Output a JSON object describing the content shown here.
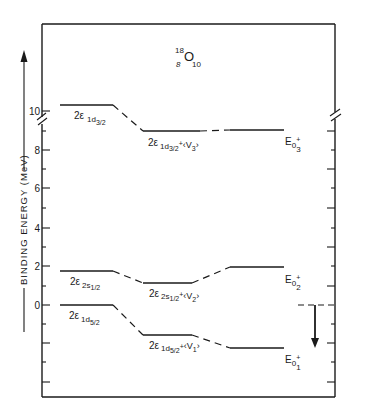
{
  "title": {
    "mass_number": "18",
    "element": "O",
    "proton_number": "8",
    "neutron_number": "10"
  },
  "axis": {
    "label": "BINDING ENERGY (MeV)",
    "direction_arrow": "up",
    "ticks": [
      "10",
      "8",
      "6",
      "4",
      "2",
      "0"
    ],
    "tick_values": [
      10,
      8,
      6,
      4,
      2,
      0
    ],
    "axis_break_between": [
      8,
      10
    ]
  },
  "levels": {
    "unperturbed": [
      {
        "id": "1d3/2",
        "prefix": "2ε",
        "sub": "1d",
        "subsub": "3/2",
        "energy": 10.3
      },
      {
        "id": "2s1/2",
        "prefix": "2ε",
        "sub": "2s",
        "subsub": "1/2",
        "energy": 1.7
      },
      {
        "id": "1d5/2",
        "prefix": "2ε",
        "sub": "1d",
        "subsub": "5/2",
        "energy": 0.0
      }
    ],
    "diagonal": [
      {
        "prefix": "2ε",
        "sub": "1d",
        "subsub": "3/2",
        "plus": "+",
        "v": "V",
        "vsub": "3",
        "energy": 8.9
      },
      {
        "prefix": "2ε",
        "sub": "2s",
        "subsub": "1/2",
        "plus": "+",
        "v": "V",
        "vsub": "2",
        "energy": 1.1
      },
      {
        "prefix": "2ε",
        "sub": "1d",
        "subsub": "5/2",
        "plus": "+",
        "v": "V",
        "vsub": "1",
        "energy": -1.6
      }
    ],
    "final": [
      {
        "label": "E",
        "sub": "0",
        "sup": "+",
        "index": "3",
        "energy": 9.0
      },
      {
        "label": "E",
        "sub": "0",
        "sup": "+",
        "index": "2",
        "energy": 1.9
      },
      {
        "label": "E",
        "sub": "0",
        "sup": "+",
        "index": "1",
        "energy": -2.2
      }
    ]
  },
  "annotation": {
    "reference_dashed_line_energy": 0,
    "arrow_direction": "down"
  },
  "colors": {
    "ink": "#1a1a1a",
    "background": "#ffffff"
  }
}
